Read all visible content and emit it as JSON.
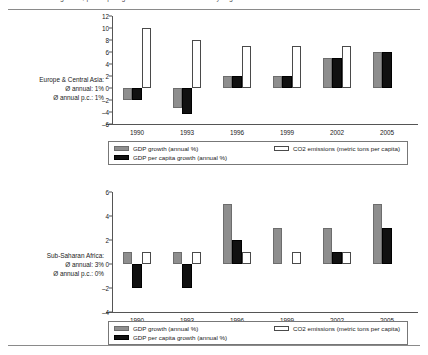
{
  "document": {
    "clipped_header": "growth, per capita growth and CO2 emissions by region"
  },
  "charts": [
    {
      "region_label": "Europe & Central Asia:",
      "annual_line": "Ø annual: 1%",
      "annual_pc_line": "Ø annual p.c.: 1%",
      "legend": {
        "gdp": "GDP growth (annual %)",
        "pc": "GDP per capita growth (annual %)",
        "co2": "CO2 emissions (metric tons per capita)"
      }
    },
    {
      "region_label": "Sub-Saharan Africa:",
      "annual_line": "Ø annual: 3%",
      "annual_pc_line": "Ø annual p.c.: 0%",
      "legend": {
        "gdp": "GDP growth (annual %)",
        "pc": "GDP per capita growth (annual %)",
        "co2": "CO2 emissions (metric tons per capita)"
      }
    }
  ],
  "chart_data": [
    {
      "type": "bar",
      "title": "Europe & Central Asia",
      "xlabel": "",
      "ylabel": "",
      "categories": [
        "1990",
        "1993",
        "1996",
        "1999",
        "2002",
        "2005"
      ],
      "yticks": [
        12,
        10,
        8,
        6,
        4,
        2,
        0,
        -2,
        -4,
        -6
      ],
      "ylim": [
        -6,
        12
      ],
      "grid": false,
      "legend_position": "bottom",
      "series": [
        {
          "name": "GDP growth (annual %)",
          "color": "#8e8e8e",
          "values": [
            -2,
            -3.3,
            2,
            2,
            5,
            6
          ]
        },
        {
          "name": "GDP per capita growth (annual %)",
          "color": "#111111",
          "values": [
            -2,
            -4.3,
            2,
            2,
            5,
            6
          ]
        },
        {
          "name": "CO2 emissions (metric tons per capita)",
          "color": "#ffffff",
          "values": [
            10,
            8,
            7,
            7,
            7,
            0
          ]
        }
      ]
    },
    {
      "type": "bar",
      "title": "Sub-Saharan Africa",
      "xlabel": "",
      "ylabel": "",
      "categories": [
        "1990",
        "1993",
        "1996",
        "1999",
        "2002",
        "2005"
      ],
      "yticks": [
        6,
        4,
        2,
        0,
        -2,
        -4
      ],
      "ylim": [
        -4,
        6
      ],
      "grid": false,
      "legend_position": "bottom",
      "series": [
        {
          "name": "GDP growth (annual %)",
          "color": "#8e8e8e",
          "values": [
            1,
            1,
            5,
            3,
            3,
            5
          ]
        },
        {
          "name": "GDP per capita growth (annual %)",
          "color": "#111111",
          "values": [
            -2,
            -2,
            2,
            0,
            1,
            3
          ]
        },
        {
          "name": "CO2 emissions (metric tons per capita)",
          "color": "#ffffff",
          "values": [
            1,
            1,
            1,
            1,
            1,
            0
          ]
        }
      ]
    }
  ]
}
